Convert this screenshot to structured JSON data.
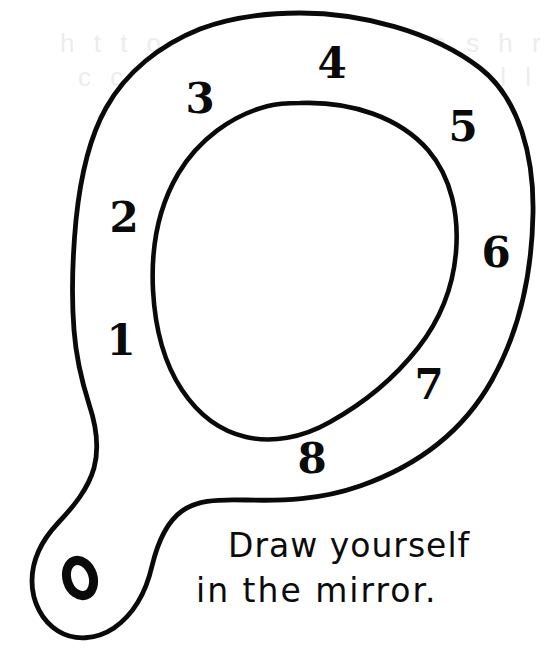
{
  "page": {
    "background_color": "#ffffff",
    "ink_color": "#0a0a0a",
    "width": 558,
    "height": 661
  },
  "artwork": {
    "title": "Hand mirror coloring outline",
    "description": "Hand-drawn outline of a hand mirror with a numbered frame ring, an empty oval glass, and a handle with a hanging hole",
    "stroke_color": "#0a0a0a",
    "fill_color": "#ffffff",
    "stroke_width": 4.6
  },
  "numbers": [
    {
      "label": "1",
      "x": 121,
      "y": 341,
      "size": 42
    },
    {
      "label": "2",
      "x": 124,
      "y": 218,
      "size": 42
    },
    {
      "label": "3",
      "x": 200,
      "y": 99,
      "size": 42
    },
    {
      "label": "4",
      "x": 332,
      "y": 64,
      "size": 42
    },
    {
      "label": "5",
      "x": 463,
      "y": 127,
      "size": 42
    },
    {
      "label": "6",
      "x": 496,
      "y": 253,
      "size": 42
    },
    {
      "label": "7",
      "x": 429,
      "y": 385,
      "size": 42
    },
    {
      "label": "8",
      "x": 312,
      "y": 459,
      "size": 42
    }
  ],
  "handle_hole": {
    "label": "0",
    "x": 80,
    "y": 578,
    "description": "small tilted oval hole punched in the mirror handle"
  },
  "caption": {
    "line1": "Draw yourself",
    "line2": "in the mirror.",
    "full_text": "Draw yourself in the mirror."
  },
  "ghost_text": {
    "line1": "h t t o   a a d v   f l b   h a   s h r",
    "line2": "c c v   l m t r n   t r l   v t p l l"
  }
}
